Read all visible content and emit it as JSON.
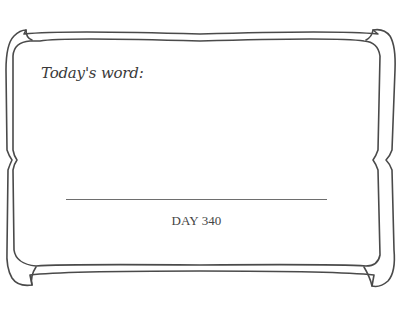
{
  "card": {
    "prompt_label": "Today's word:",
    "day_label": "DAY 340",
    "colors": {
      "background": "#ffffff",
      "frame_stroke": "#4a4a4a",
      "text": "#3a3a3a",
      "line": "#6e6e6e"
    }
  },
  "icons": {
    "frame": "ornamental-double-border"
  }
}
